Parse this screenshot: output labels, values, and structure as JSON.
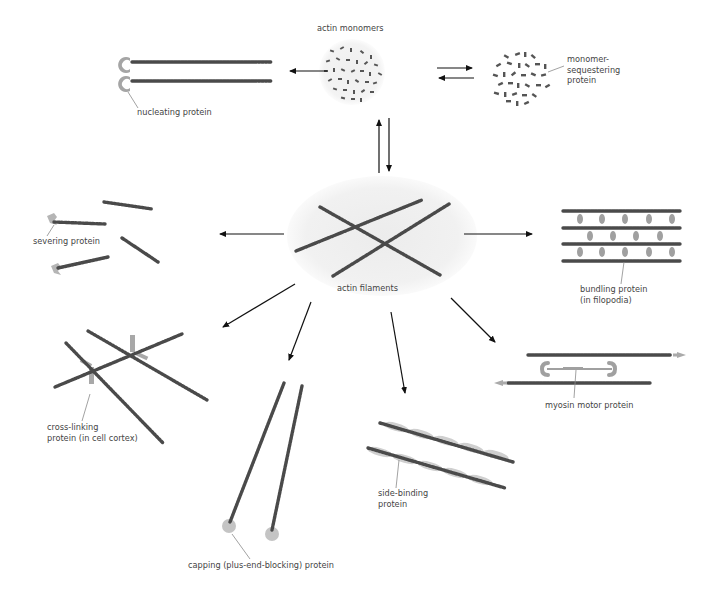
{
  "figure": {
    "center": {
      "label": "actin filaments",
      "description": "cluster of crossed actin filaments on a light gray oval"
    },
    "top": {
      "monomers_label": "actin monomers",
      "sequestering_label_line1": "monomer-",
      "sequestering_label_line2": "sequestering",
      "sequestering_label_line3": "protein",
      "nucleating_label": "nucleating protein"
    },
    "outcomes": [
      {
        "id": "severing",
        "label": "severing protein"
      },
      {
        "id": "bundling",
        "label_line1": "bundling protein",
        "label_line2": "(in filopodia)"
      },
      {
        "id": "cross-linking",
        "label_line1": "cross-linking",
        "label_line2": "protein (in cell cortex)"
      },
      {
        "id": "capping",
        "label": "capping (plus-end-blocking) protein"
      },
      {
        "id": "side-binding",
        "label_line1": "side-binding",
        "label_line2": "protein"
      },
      {
        "id": "myosin",
        "label": "myosin motor protein"
      }
    ],
    "colors": {
      "filament": "#4a4a4a",
      "protein_gray": "#a8a8a8",
      "background_oval": "#f0f0f0",
      "arrow": "#111111"
    }
  }
}
